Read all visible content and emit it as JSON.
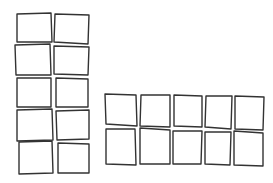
{
  "diagram": {
    "stroke_color": "#333333",
    "background": "#ffffff",
    "groups": [
      {
        "name": "left-grid",
        "layout": "2 columns x 5 rows",
        "boxes": [
          {
            "pts": "17,14 51,13 52,42 17,42"
          },
          {
            "pts": "55,14 89,15 88,44 54,42"
          },
          {
            "pts": "15,45 50,44 51,75 16,75"
          },
          {
            "pts": "54,46 89,47 88,75 54,74"
          },
          {
            "pts": "17,78 51,78 51,107 17,107"
          },
          {
            "pts": "56,78 88,79 88,107 56,107"
          },
          {
            "pts": "17,110 52,109 53,140 17,141"
          },
          {
            "pts": "56,111 89,110 89,139 57,140"
          },
          {
            "pts": "19,142 52,141 53,173 19,174"
          },
          {
            "pts": "58,143 89,144 89,173 58,173"
          }
        ]
      },
      {
        "name": "right-grid",
        "layout": "5 columns x 2 rows",
        "boxes": [
          {
            "pts": "105,94 136,95 137,126 106,124"
          },
          {
            "pts": "141,95 170,95 170,127 140,126"
          },
          {
            "pts": "174,95 202,96 202,127 174,126"
          },
          {
            "pts": "206,96 232,96 231,129 205,127"
          },
          {
            "pts": "235,96 264,97 263,130 235,129"
          },
          {
            "pts": "106,129 135,129 136,165 106,164"
          },
          {
            "pts": "140,128 170,130 170,164 140,164"
          },
          {
            "pts": "173,131 202,131 201,164 173,164"
          },
          {
            "pts": "205,132 231,132 230,165 205,164"
          },
          {
            "pts": "234,131 263,133 263,166 234,165"
          }
        ]
      }
    ]
  }
}
